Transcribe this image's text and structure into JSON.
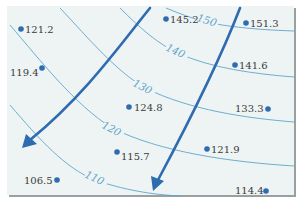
{
  "map": {
    "type": "contour-map",
    "background_color": "#eef4f4",
    "contour_color": "#5fa6c9",
    "arrow_color": "#2e6bb0",
    "point_color": "#2e6bb0",
    "contours": [
      {
        "value": "150",
        "label": "150"
      },
      {
        "value": "140",
        "label": "140"
      },
      {
        "value": "130",
        "label": "130"
      },
      {
        "value": "120",
        "label": "120"
      },
      {
        "value": "110",
        "label": "110"
      }
    ],
    "points": [
      {
        "label": "121.2",
        "x": 20,
        "y": 29
      },
      {
        "label": "119.4",
        "x": 42,
        "y": 69
      },
      {
        "label": "145.2",
        "x": 166,
        "y": 19
      },
      {
        "label": "151.3",
        "x": 246,
        "y": 23
      },
      {
        "label": "141.6",
        "x": 235,
        "y": 65
      },
      {
        "label": "124.8",
        "x": 129,
        "y": 107
      },
      {
        "label": "133.3",
        "x": 268,
        "y": 108
      },
      {
        "label": "115.7",
        "x": 117,
        "y": 153
      },
      {
        "label": "121.9",
        "x": 206,
        "y": 148
      },
      {
        "label": "106.5",
        "x": 56,
        "y": 180
      },
      {
        "label": "114.4",
        "x": 266,
        "y": 191
      }
    ],
    "flow_arrows": [
      {
        "name": "left-flow-arrow",
        "direction": "down-left"
      },
      {
        "name": "right-flow-arrow",
        "direction": "down"
      }
    ]
  }
}
